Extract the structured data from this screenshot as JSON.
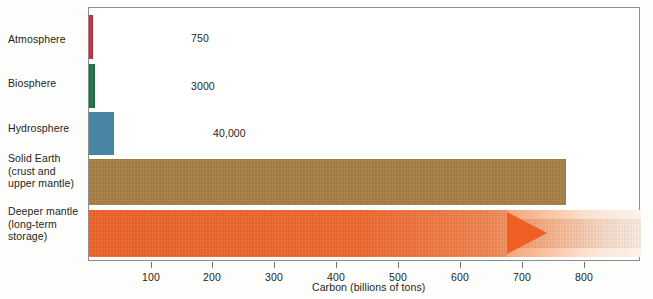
{
  "chart_data": {
    "type": "bar",
    "orientation": "horizontal",
    "title": "",
    "xlabel": "Carbon (billions of tons)",
    "ylabel": "",
    "xlim": [
      0,
      893
    ],
    "grid": false,
    "legend": false,
    "xticks": [
      100,
      200,
      300,
      400,
      500,
      600,
      700,
      800
    ],
    "xticklabels": [
      "100",
      "200",
      "300",
      "400",
      "500",
      "600",
      "700",
      "800"
    ],
    "categories": [
      "Atmosphere",
      "Biosphere",
      "Hydrosphere",
      "Solid Earth (crust and upper mantle)",
      "Deeper mantle (long-term storage)"
    ],
    "values": [
      7,
      9,
      40,
      770,
      null
    ],
    "data_labels": [
      "750",
      "3000",
      "40,000",
      "750,000",
      "???"
    ]
  },
  "categories": [
    {
      "id": "atmosphere",
      "lines": [
        "Atmosphere"
      ],
      "value_label": "750",
      "color": "#c32032"
    },
    {
      "id": "biosphere",
      "lines": [
        "Biosphere"
      ],
      "value_label": "3000",
      "color": "#1d6b3f"
    },
    {
      "id": "hydrosphere",
      "lines": [
        "Hydrosphere"
      ],
      "value_label": "40,000",
      "color": "#4a85a3"
    },
    {
      "id": "solid-earth",
      "lines": [
        "Solid Earth",
        "(crust and",
        "upper mantle)"
      ],
      "value_label": "750,000",
      "color": "#a97f42"
    },
    {
      "id": "deeper-mantle",
      "lines": [
        "Deeper mantle",
        "(long-term",
        "storage)"
      ],
      "value_label": "???",
      "color": "#f2622a"
    }
  ],
  "axis": {
    "title": "Carbon (billions of tons)",
    "ticks": [
      {
        "label": "100",
        "x": 62
      },
      {
        "label": "200",
        "x": 123
      },
      {
        "label": "300",
        "x": 185
      },
      {
        "label": "400",
        "x": 247
      },
      {
        "label": "500",
        "x": 309
      },
      {
        "label": "600",
        "x": 371
      },
      {
        "label": "700",
        "x": 433
      },
      {
        "label": "800",
        "x": 495
      }
    ]
  },
  "colors": {
    "atmosphere": "#c32032",
    "biosphere": "#1d6b3f",
    "hydrosphere": "#4a85a3",
    "solid_earth": "#a97f42",
    "deeper_mantle": "#f2622a",
    "frame": "#8d8d8d",
    "text": "#231f20",
    "background": "#ffffff"
  }
}
